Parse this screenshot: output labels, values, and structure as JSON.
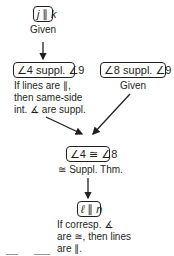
{
  "diagram": {
    "type": "flow-proof",
    "nodes": [
      {
        "id": "n1",
        "statement": "j ∥ k",
        "reason": "Given"
      },
      {
        "id": "n2",
        "statement": "∠4 suppl. ∠9",
        "reason_lines": [
          "If lines are ∥,",
          "then same-side",
          "int. ∡ are suppl."
        ]
      },
      {
        "id": "n3",
        "statement": "∠8 suppl. ∠9",
        "reason": "Given"
      },
      {
        "id": "n4",
        "statement": "∠4 ≅ ∠8",
        "reason": "≅ Suppl. Thm."
      },
      {
        "id": "n5",
        "statement": "ℓ ∥ n",
        "reason_lines": [
          "If corresp. ∡",
          "are ≅, then lines",
          "are ∥."
        ]
      }
    ],
    "edges": [
      {
        "from": "n1",
        "to": "n2"
      },
      {
        "from": "n2",
        "to": "n4"
      },
      {
        "from": "n3",
        "to": "n4"
      },
      {
        "from": "n4",
        "to": "n5"
      }
    ],
    "colors": {
      "stroke": "#231f20",
      "background": "#ffffff"
    }
  }
}
